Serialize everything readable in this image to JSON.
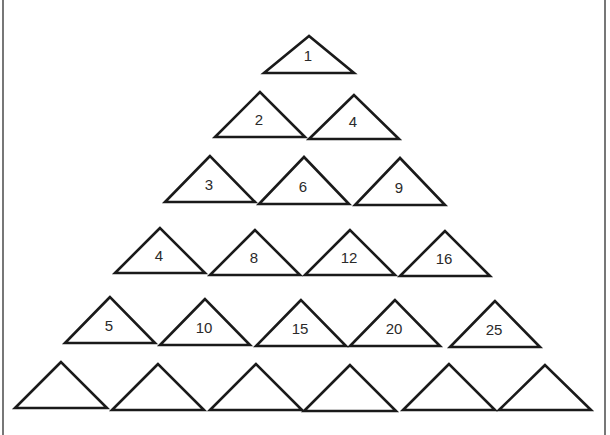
{
  "rows": [
    {
      "row": 1,
      "triangles": [
        {
          "label": "1",
          "apex": [
            309,
            36
          ],
          "base_y": 73,
          "half_w": 45
        }
      ]
    },
    {
      "row": 2,
      "triangles": [
        {
          "label": "2",
          "apex": [
            260,
            92
          ],
          "base_y": 137,
          "half_w": 45
        },
        {
          "label": "4",
          "apex": [
            354,
            95
          ],
          "base_y": 139,
          "half_w": 45
        }
      ]
    },
    {
      "row": 3,
      "triangles": [
        {
          "label": "3",
          "apex": [
            210,
            156
          ],
          "base_y": 202,
          "half_w": 45
        },
        {
          "label": "6",
          "apex": [
            304,
            157
          ],
          "base_y": 204,
          "half_w": 45
        },
        {
          "label": "9",
          "apex": [
            400,
            158
          ],
          "base_y": 205,
          "half_w": 45
        }
      ]
    },
    {
      "row": 4,
      "triangles": [
        {
          "label": "4",
          "apex": [
            160,
            228
          ],
          "base_y": 273,
          "half_w": 45
        },
        {
          "label": "8",
          "apex": [
            255,
            230
          ],
          "base_y": 275,
          "half_w": 45
        },
        {
          "label": "12",
          "apex": [
            350,
            230
          ],
          "base_y": 275,
          "half_w": 45
        },
        {
          "label": "16",
          "apex": [
            445,
            231
          ],
          "base_y": 276,
          "half_w": 45
        }
      ]
    },
    {
      "row": 5,
      "triangles": [
        {
          "label": "5",
          "apex": [
            110,
            297
          ],
          "base_y": 343,
          "half_w": 45
        },
        {
          "label": "10",
          "apex": [
            205,
            299
          ],
          "base_y": 345,
          "half_w": 45
        },
        {
          "label": "15",
          "apex": [
            301,
            300
          ],
          "base_y": 346,
          "half_w": 45
        },
        {
          "label": "20",
          "apex": [
            395,
            300
          ],
          "base_y": 346,
          "half_w": 45
        },
        {
          "label": "25",
          "apex": [
            495,
            301
          ],
          "base_y": 347,
          "half_w": 45
        }
      ]
    },
    {
      "row": 6,
      "triangles": [
        {
          "label": "",
          "apex": [
            61,
            362
          ],
          "base_y": 408,
          "half_w": 46
        },
        {
          "label": "",
          "apex": [
            158,
            364
          ],
          "base_y": 410,
          "half_w": 46
        },
        {
          "label": "",
          "apex": [
            256,
            364
          ],
          "base_y": 410,
          "half_w": 46
        },
        {
          "label": "",
          "apex": [
            350,
            365
          ],
          "base_y": 411,
          "half_w": 46
        },
        {
          "label": "",
          "apex": [
            449,
            364
          ],
          "base_y": 410,
          "half_w": 46
        },
        {
          "label": "",
          "apex": [
            545,
            365
          ],
          "base_y": 410,
          "half_w": 46
        }
      ]
    }
  ]
}
